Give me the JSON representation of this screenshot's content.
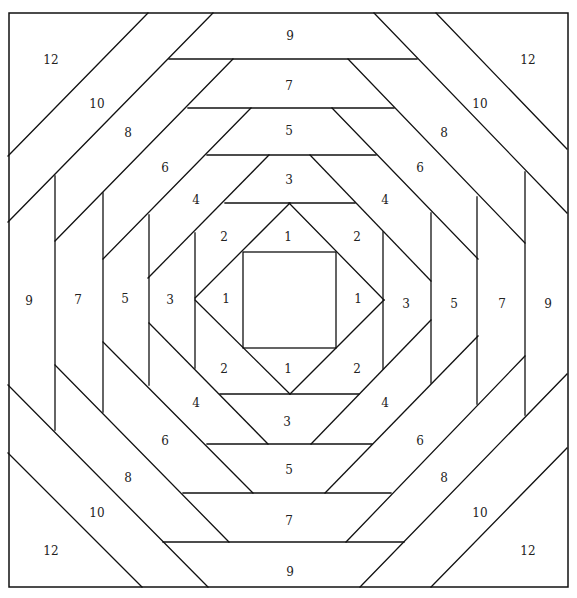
{
  "diagram": {
    "type": "pineapple quilt block piecing diagram",
    "border": {
      "x": 9,
      "y": 13,
      "width": 559,
      "height": 574
    },
    "colors": {
      "line": "#111111",
      "background": "#ffffff",
      "text": "#222222"
    },
    "center_square": {
      "x": 243,
      "y": 252,
      "width": 93,
      "height": 96
    },
    "labels": [
      {
        "text": "12",
        "x": 51,
        "y": 60
      },
      {
        "text": "12",
        "x": 528,
        "y": 60
      },
      {
        "text": "12",
        "x": 51,
        "y": 551
      },
      {
        "text": "12",
        "x": 528,
        "y": 551
      },
      {
        "text": "10",
        "x": 97,
        "y": 104
      },
      {
        "text": "10",
        "x": 480,
        "y": 104
      },
      {
        "text": "10",
        "x": 97,
        "y": 513
      },
      {
        "text": "10",
        "x": 480,
        "y": 513
      },
      {
        "text": "8",
        "x": 128,
        "y": 133
      },
      {
        "text": "8",
        "x": 444,
        "y": 133
      },
      {
        "text": "8",
        "x": 128,
        "y": 478
      },
      {
        "text": "8",
        "x": 444,
        "y": 478
      },
      {
        "text": "6",
        "x": 165,
        "y": 168
      },
      {
        "text": "6",
        "x": 420,
        "y": 168
      },
      {
        "text": "6",
        "x": 165,
        "y": 441
      },
      {
        "text": "6",
        "x": 420,
        "y": 441
      },
      {
        "text": "4",
        "x": 196,
        "y": 200
      },
      {
        "text": "4",
        "x": 385,
        "y": 200
      },
      {
        "text": "4",
        "x": 196,
        "y": 403
      },
      {
        "text": "4",
        "x": 385,
        "y": 403
      },
      {
        "text": "2",
        "x": 224,
        "y": 237
      },
      {
        "text": "2",
        "x": 357,
        "y": 237
      },
      {
        "text": "2",
        "x": 224,
        "y": 369
      },
      {
        "text": "2",
        "x": 357,
        "y": 369
      },
      {
        "text": "1",
        "x": 288,
        "y": 237
      },
      {
        "text": "1",
        "x": 226,
        "y": 299
      },
      {
        "text": "1",
        "x": 358,
        "y": 299
      },
      {
        "text": "1",
        "x": 288,
        "y": 369
      },
      {
        "text": "9",
        "x": 290,
        "y": 36
      },
      {
        "text": "7",
        "x": 289,
        "y": 86
      },
      {
        "text": "5",
        "x": 289,
        "y": 131
      },
      {
        "text": "3",
        "x": 289,
        "y": 180
      },
      {
        "text": "3",
        "x": 287,
        "y": 422
      },
      {
        "text": "5",
        "x": 289,
        "y": 470
      },
      {
        "text": "7",
        "x": 289,
        "y": 521
      },
      {
        "text": "9",
        "x": 290,
        "y": 572
      },
      {
        "text": "9",
        "x": 29,
        "y": 301
      },
      {
        "text": "7",
        "x": 78,
        "y": 300
      },
      {
        "text": "5",
        "x": 125,
        "y": 299
      },
      {
        "text": "3",
        "x": 170,
        "y": 300
      },
      {
        "text": "3",
        "x": 406,
        "y": 304
      },
      {
        "text": "5",
        "x": 454,
        "y": 304
      },
      {
        "text": "7",
        "x": 502,
        "y": 304
      },
      {
        "text": "9",
        "x": 548,
        "y": 304
      }
    ],
    "lines": [
      [
        8,
        156,
        148,
        13
      ],
      [
        8,
        222,
        213,
        13
      ],
      [
        55,
        241,
        233,
        59
      ],
      [
        103,
        259,
        251,
        108
      ],
      [
        148,
        278,
        269,
        155
      ],
      [
        195,
        298,
        290,
        203
      ],
      [
        436,
        13,
        567,
        149
      ],
      [
        374,
        13,
        567,
        213
      ],
      [
        348,
        59,
        525,
        243
      ],
      [
        332,
        108,
        478,
        259
      ],
      [
        310,
        155,
        431,
        281
      ],
      [
        289,
        203,
        384,
        300
      ],
      [
        8,
        453,
        142,
        587
      ],
      [
        8,
        385,
        208,
        587
      ],
      [
        55,
        365,
        229,
        542
      ],
      [
        103,
        342,
        253,
        493
      ],
      [
        149,
        323,
        268,
        444
      ],
      [
        195,
        300,
        290,
        394
      ],
      [
        567,
        448,
        431,
        587
      ],
      [
        567,
        374,
        360,
        587
      ],
      [
        525,
        356,
        346,
        542
      ],
      [
        478,
        336,
        325,
        493
      ],
      [
        431,
        320,
        311,
        444
      ],
      [
        384,
        300,
        290,
        394
      ],
      [
        169,
        59,
        417,
        59
      ],
      [
        188,
        108,
        394,
        108
      ],
      [
        207,
        155,
        376,
        155
      ],
      [
        225,
        203,
        355,
        203
      ],
      [
        220,
        394,
        359,
        394
      ],
      [
        207,
        444,
        372,
        444
      ],
      [
        183,
        493,
        391,
        493
      ],
      [
        163,
        542,
        404,
        542
      ],
      [
        55,
        176,
        55,
        430
      ],
      [
        103,
        193,
        103,
        412
      ],
      [
        149,
        215,
        149,
        385
      ],
      [
        195,
        233,
        195,
        368
      ],
      [
        383,
        232,
        383,
        369
      ],
      [
        431,
        213,
        431,
        383
      ],
      [
        477,
        197,
        477,
        404
      ],
      [
        525,
        172,
        525,
        415
      ]
    ]
  }
}
